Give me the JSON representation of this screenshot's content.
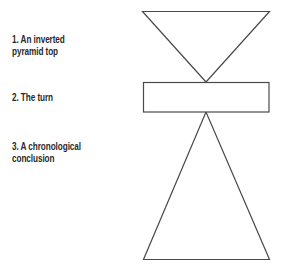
{
  "diagram": {
    "labels": [
      {
        "line1": "1. An inverted",
        "line2": "pyramid top"
      },
      {
        "line1": "2. The turn",
        "line2": ""
      },
      {
        "line1": "3. A chronological",
        "line2": "conclusion"
      }
    ],
    "shapes": {
      "top": "inverted-triangle",
      "middle": "rectangle",
      "bottom": "triangle"
    },
    "colors": {
      "stroke": "#4a4a4a",
      "fill": "#ffffff",
      "text": "#2a2a2a",
      "background": "#ffffff"
    }
  }
}
